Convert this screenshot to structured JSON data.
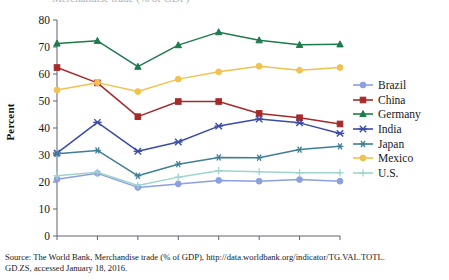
{
  "figure": {
    "cut_title_fragment": "Merchandise trade (% of GDP)",
    "source_line1": "Source: The World Bank, Merchandise trade (% of GDP), http://data.worldbank.org/indicator/TG.VAL.TOTL.",
    "source_line2": "GD.ZS, accessed January 18, 2016."
  },
  "chart_data": {
    "type": "line",
    "title": "",
    "xlabel": "",
    "ylabel": "Percent",
    "x": [
      "2007",
      "2008",
      "2009",
      "2010",
      "2011",
      "2012",
      "2013",
      "2014"
    ],
    "xlim": [
      2007,
      2014
    ],
    "ylim": [
      0,
      80
    ],
    "yticks": [
      0,
      10,
      20,
      30,
      40,
      50,
      60,
      70,
      80
    ],
    "ytick_labels": [
      "0",
      "10",
      "20",
      "30",
      "40",
      "50",
      "60",
      "70",
      "80"
    ],
    "grid": false,
    "legend_position": "right",
    "series": [
      {
        "name": "Brazil",
        "color": "#8c9fe0",
        "marker": "circle",
        "values": [
          21.0,
          23.2,
          18.0,
          19.3,
          20.6,
          20.3,
          20.9,
          20.3
        ]
      },
      {
        "name": "China",
        "color": "#a52a2a",
        "marker": "square",
        "values": [
          62.4,
          56.7,
          44.2,
          49.8,
          49.8,
          45.4,
          43.8,
          41.5
        ]
      },
      {
        "name": "Germany",
        "color": "#1f7a4d",
        "marker": "triangle",
        "values": [
          71.3,
          72.3,
          62.7,
          70.7,
          75.5,
          72.5,
          70.8,
          71.0
        ]
      },
      {
        "name": "India",
        "color": "#3b4ba8",
        "marker": "x-bar",
        "values": [
          30.7,
          42.1,
          31.4,
          34.8,
          40.7,
          43.3,
          41.9,
          38.0
        ]
      },
      {
        "name": "Japan",
        "color": "#3f7f93",
        "marker": "asterisk",
        "values": [
          30.5,
          31.7,
          22.3,
          26.6,
          29.1,
          29.0,
          32.0,
          33.2
        ]
      },
      {
        "name": "Mexico",
        "color": "#f2c14e",
        "marker": "circle",
        "values": [
          54.1,
          56.8,
          53.5,
          58.1,
          60.8,
          62.9,
          61.4,
          62.4
        ]
      },
      {
        "name": "U.S.",
        "color": "#9fd4cd",
        "marker": "plus",
        "values": [
          22.3,
          23.6,
          18.7,
          21.8,
          24.2,
          23.8,
          23.4,
          23.4
        ]
      }
    ]
  },
  "legend": {
    "items": [
      {
        "label": "Brazil"
      },
      {
        "label": "China"
      },
      {
        "label": "Germany"
      },
      {
        "label": "India"
      },
      {
        "label": "Japan"
      },
      {
        "label": "Mexico"
      },
      {
        "label": "U.S."
      }
    ]
  }
}
